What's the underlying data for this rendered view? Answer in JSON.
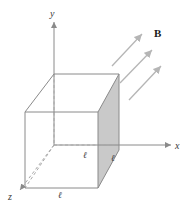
{
  "figure": {
    "type": "physics-diagram",
    "background_color": "#ffffff",
    "stroke_color": "#8a8a8a",
    "dashed_color": "#a8a8a8",
    "shaded_face_color": "#c9c9c9",
    "arrow_color": "#b0b0b0",
    "label_color": "#3a3a3a"
  },
  "axes": [
    {
      "name": "y-axis",
      "label": "y",
      "label_x": 50,
      "label_y": 9
    },
    {
      "name": "x-axis",
      "label": "x",
      "label_x": 175,
      "label_y": 141
    },
    {
      "name": "z-axis",
      "label": "z",
      "label_x": 8,
      "label_y": 192
    }
  ],
  "cube": {
    "edge_labels": [
      {
        "name": "edge-label-depth",
        "text": "ℓ",
        "x": 83,
        "y": 151
      },
      {
        "name": "edge-label-width",
        "text": "ℓ",
        "x": 111,
        "y": 154
      },
      {
        "name": "edge-label-bottom",
        "text": "ℓ",
        "x": 58,
        "y": 191
      }
    ]
  },
  "field": {
    "label": "B",
    "label_x": 154,
    "label_y": 28,
    "arrow_count": 3,
    "arrow_direction": "up-right"
  }
}
